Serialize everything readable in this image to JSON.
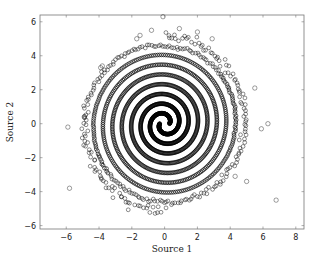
{
  "chart_data": {
    "type": "scatter",
    "title": "",
    "xlabel": "Source 1",
    "ylabel": "Source 2",
    "xlim": [
      -7.6,
      8.5
    ],
    "ylim": [
      -6.2,
      6.4
    ],
    "xticks": [
      -6,
      -4,
      -2,
      0,
      2,
      4,
      6,
      8
    ],
    "yticks": [
      -6,
      -4,
      -2,
      0,
      2,
      4,
      6
    ],
    "xtick_labels": [
      "−6",
      "−4",
      "−2",
      "0",
      "2",
      "4",
      "6",
      "8"
    ],
    "ytick_labels": [
      "−6",
      "−4",
      "−2",
      "0",
      "2",
      "4",
      "6"
    ],
    "grid": false,
    "legend": null,
    "marker": "open-circle",
    "marker_color": "#000000",
    "series": [
      {
        "name": "spiral-arm-1",
        "kind": "archimedean-spiral",
        "r_start": 0.3,
        "r_end": 5.2,
        "turns": 4.25,
        "phase_deg": 0,
        "n_points": 900
      },
      {
        "name": "spiral-arm-2",
        "kind": "archimedean-spiral",
        "r_start": 0.3,
        "r_end": 5.2,
        "turns": 4.25,
        "phase_deg": 180,
        "n_points": 900
      },
      {
        "name": "outliers",
        "kind": "points",
        "x": [
          -0.1,
          -5.9,
          -5.8,
          -1.7,
          -0.8,
          0.9,
          5.5,
          6.8,
          6.3,
          5.9,
          5.0,
          4.3,
          -3.9,
          -3.8,
          2.0,
          -4.9,
          -1.5,
          2.9
        ],
        "y": [
          6.3,
          -0.2,
          -3.8,
          5.0,
          5.5,
          5.6,
          2.1,
          -4.5,
          0.0,
          -0.3,
          -3.4,
          -3.1,
          3.3,
          3.4,
          5.4,
          0.4,
          5.2,
          5.0
        ]
      }
    ]
  },
  "axes": {
    "xlabel": "Source 1",
    "ylabel": "Source 2"
  }
}
